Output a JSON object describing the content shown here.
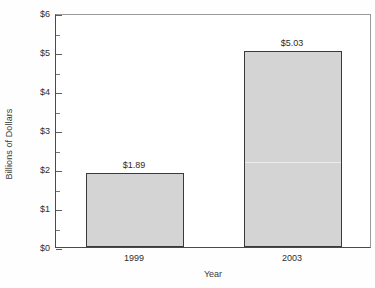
{
  "chart_data": {
    "type": "bar",
    "title": "",
    "xlabel": "Year",
    "ylabel": "Billions of Dollars",
    "categories": [
      "1999",
      "2003"
    ],
    "values": [
      1.89,
      5.03
    ],
    "value_labels": [
      "$1.89",
      "$5.03"
    ],
    "ylim": [
      0,
      6
    ],
    "ytick_values": [
      0,
      1,
      2,
      3,
      4,
      5,
      6
    ],
    "ytick_labels": [
      "$0",
      "$1",
      "$2",
      "$3",
      "$4",
      "$5",
      "$6"
    ],
    "yminor_values": [
      0.5,
      1.5,
      2.5,
      3.5,
      4.5,
      5.5
    ],
    "grid": false,
    "legend": null,
    "bar_fill_color": "#d4d4d4",
    "bar_edge_color": "#3a3a3a",
    "plot_background": "#ffffff",
    "axis_color": "#4a4a4a"
  }
}
